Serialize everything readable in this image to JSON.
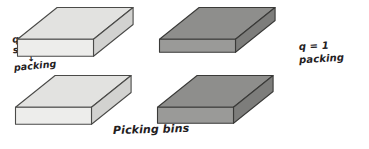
{
  "figure": {
    "background_color": "#ffffff",
    "ink_color": "#23201e"
  },
  "annotations": {
    "left": {
      "name": "left-annotation",
      "line1": "q>1",
      "line2": "sorting",
      "arrow": "↓",
      "line3": "packing"
    },
    "right": {
      "name": "right-annotation",
      "line1": "q = 1",
      "line2": "packing"
    },
    "caption": "Picking bins"
  },
  "bins": [
    {
      "id": "bin-top-left",
      "label": "sorting bin top left",
      "group": "left",
      "color_top": "#e2e2e0",
      "color_front": "#ededeb",
      "color_side": "#d2d2d0",
      "stroke": "#4a4a48",
      "x": 16,
      "y": 6,
      "width": 76,
      "depth": 30,
      "height": 17
    },
    {
      "id": "bin-bottom-left",
      "label": "sorting bin bottom left",
      "group": "left",
      "color_top": "#e2e2e0",
      "color_front": "#ededeb",
      "color_side": "#d2d2d0",
      "stroke": "#4a4a48",
      "x": 14,
      "y": 74,
      "width": 76,
      "depth": 30,
      "height": 17
    },
    {
      "id": "bin-top-right",
      "label": "packing bin top right",
      "group": "right",
      "color_top": "#8e8e8c",
      "color_front": "#9a9a98",
      "color_side": "#7d7d7b",
      "stroke": "#3a3a38",
      "x": 158,
      "y": 6,
      "width": 76,
      "depth": 30,
      "height": 13
    },
    {
      "id": "bin-bottom-right",
      "label": "packing bin bottom right",
      "group": "right",
      "color_top": "#8e8e8c",
      "color_front": "#9a9a98",
      "color_side": "#7d7d7b",
      "stroke": "#3a3a38",
      "x": 156,
      "y": 74,
      "width": 76,
      "depth": 30,
      "height": 16
    }
  ]
}
